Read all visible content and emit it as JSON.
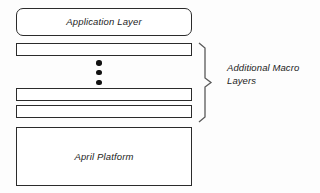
{
  "diagram": {
    "type": "layered-architecture-stack",
    "background_color": "#fdfdfd",
    "stroke_color": "#2b2b2b",
    "text_color": "#1b1b1b",
    "boxes": [
      {
        "id": "application-layer",
        "label": "Application Layer",
        "shape": "rounded-rectangle",
        "has_label": true
      },
      {
        "id": "macro-layer-bar-1",
        "label": "",
        "shape": "rectangle",
        "has_label": false
      },
      {
        "id": "macro-layer-bar-2",
        "label": "",
        "shape": "rectangle",
        "has_label": false
      },
      {
        "id": "macro-layer-bar-3",
        "label": "",
        "shape": "rectangle",
        "has_label": false
      },
      {
        "id": "april-platform",
        "label": "April Platform",
        "shape": "rectangle",
        "has_label": true
      }
    ],
    "ellipsis": {
      "icon": "vertical-ellipsis-icon",
      "dot_count": 3,
      "meaning": "continuation of repeated layers"
    },
    "brace_annotation": {
      "icon": "curly-brace-right-icon",
      "label_line_1": "Additional Macro",
      "label_line_2": "Layers",
      "spans": [
        "macro-layer-bar-1",
        "macro-layer-bar-2",
        "macro-layer-bar-3"
      ]
    }
  }
}
